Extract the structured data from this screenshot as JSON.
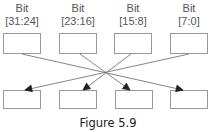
{
  "diagram": {
    "sources": [
      {
        "line1": "Bit",
        "line2": "[31:24]"
      },
      {
        "line1": "Bit",
        "line2": "[23:16]"
      },
      {
        "line1": "Bit",
        "line2": "[15:8]"
      },
      {
        "line1": "Bit",
        "line2": "[7:0]"
      }
    ],
    "destinations": [
      "",
      "",
      "",
      ""
    ],
    "mapping": [
      {
        "from": 0,
        "to": 3
      },
      {
        "from": 1,
        "to": 2
      },
      {
        "from": 2,
        "to": 1
      },
      {
        "from": 3,
        "to": 0
      }
    ],
    "colors": {
      "box_stroke": "#999999",
      "line": "#777777",
      "arrowhead": "#222222"
    }
  },
  "caption": "Figure 5.9"
}
